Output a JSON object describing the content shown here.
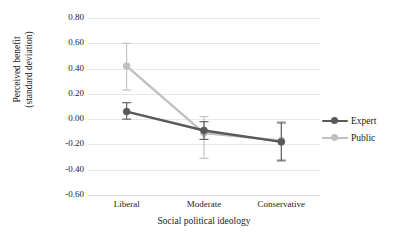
{
  "chart_data": {
    "type": "line",
    "title": "",
    "xlabel": "Social political ideology",
    "ylabel": "Perceived benefit (standard deviation)",
    "ylabel_line1": "Perceived benefit",
    "ylabel_line2": "(standard deviation)",
    "categories": [
      "Liberal",
      "Moderate",
      "Conservative"
    ],
    "ylim": [
      -0.6,
      0.8
    ],
    "ytick_labels": [
      "0.80",
      "0.60",
      "0.40",
      "0.20",
      "0.00",
      "-0.20",
      "-0.40",
      "-0.60"
    ],
    "ytick_values": [
      0.8,
      0.6,
      0.4,
      0.2,
      0.0,
      -0.2,
      -0.4,
      -0.6
    ],
    "grid": true,
    "legend_position": "right",
    "series": [
      {
        "name": "Expert",
        "color": "#595959",
        "values": [
          0.06,
          -0.09,
          -0.18
        ],
        "err_low": [
          0.0,
          -0.16,
          -0.33
        ],
        "err_high": [
          0.13,
          -0.02,
          -0.03
        ]
      },
      {
        "name": "Public",
        "color": "#c0c0c0",
        "values": [
          0.42,
          -0.11,
          -0.17
        ],
        "err_low": [
          0.23,
          -0.31,
          -0.32
        ],
        "err_high": [
          0.6,
          0.02,
          -0.02
        ]
      }
    ]
  },
  "legend": {
    "items": [
      {
        "label": "Expert",
        "color": "#595959"
      },
      {
        "label": "Public",
        "color": "#c0c0c0"
      }
    ]
  },
  "colors": {
    "expert": "#595959",
    "public": "#c0c0c0",
    "grid": "#e8e8e8",
    "text": "#1a1a1a",
    "background": "#ffffff"
  }
}
